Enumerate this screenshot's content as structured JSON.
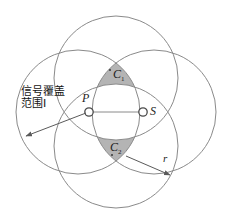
{
  "figure": {
    "labels": {
      "coverage_line1": "信号覆盖",
      "coverage_line2": "范围I",
      "point_p": "P",
      "point_s": "S",
      "region_c1_base": "C",
      "region_c1_sub": "1",
      "region_c2_base": "C",
      "region_c2_sub": "2",
      "radius": "r"
    },
    "colors": {
      "stroke": "#8a8a8a",
      "shaded_fill": "#b4b4b4",
      "white_fill": "#ffffff",
      "text": "#141414",
      "leader_line": "#5a5a5a"
    },
    "geometry": {
      "radius_px": 62,
      "point_p": {
        "x": 89,
        "y": 112
      },
      "point_s": {
        "x": 143,
        "y": 112
      },
      "circles": [
        {
          "name": "circle-left",
          "cx": 78,
          "cy": 112,
          "r": 62
        },
        {
          "name": "circle-right",
          "cx": 154,
          "cy": 112,
          "r": 62
        },
        {
          "name": "circle-top",
          "cx": 116,
          "cy": 78,
          "r": 62
        },
        {
          "name": "circle-bottom",
          "cx": 116,
          "cy": 146,
          "r": 62
        }
      ],
      "radius_arrow": {
        "from": {
          "x": 126,
          "y": 156
        },
        "to": {
          "x": 172,
          "y": 176
        }
      },
      "coverage_arrow": {
        "from": {
          "x": 86,
          "y": 113
        },
        "to": {
          "x": 24,
          "y": 137
        }
      }
    }
  }
}
